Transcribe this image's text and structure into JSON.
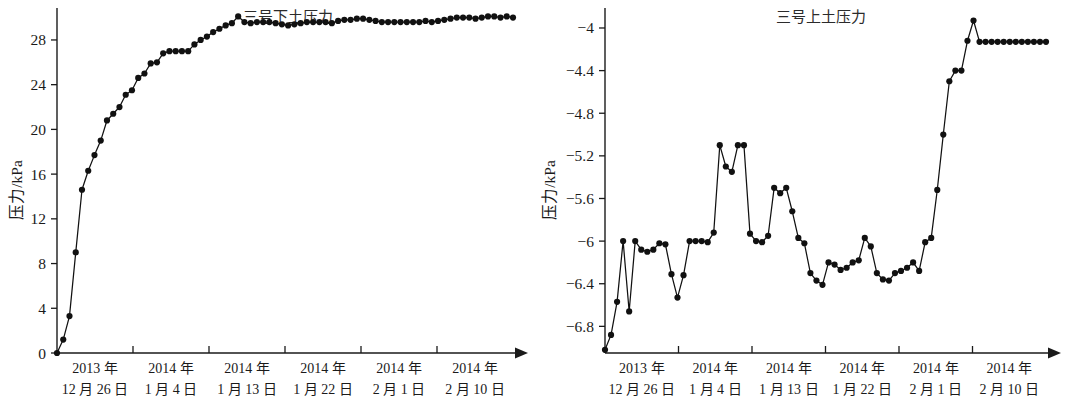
{
  "figure": {
    "background_color": "#ffffff",
    "series_color": "#111111",
    "axis_color": "#1a1a1a",
    "panel_count": 2
  },
  "chart_data": [
    {
      "type": "line",
      "panel": "left",
      "title": "三号下土压力",
      "xlabel": "",
      "ylabel": "压力/kPa",
      "ylim": [
        0,
        30.5
      ],
      "yticks": [
        0,
        4,
        8,
        12,
        16,
        20,
        24,
        28
      ],
      "ytick_labels": [
        "0",
        "4",
        "8",
        "12",
        "16",
        "20",
        "24",
        "28"
      ],
      "xtick_labels": [
        "2013 年\n12 月 26 日",
        "2014 年\n1 月 4 日",
        "2014 年\n1 月 13 日",
        "2014 年\n1 月 22 日",
        "2014 年\n2 月 1 日",
        "2014 年\n2 月 10 日"
      ],
      "xtick_label_lines": [
        [
          "2013 年",
          "12 月 26 日"
        ],
        [
          "2014 年",
          "1 月 4 日"
        ],
        [
          "2014 年",
          "1 月 13 日"
        ],
        [
          "2014 年",
          "1 月 22 日"
        ],
        [
          "2014 年",
          "2 月 1 日"
        ],
        [
          "2014 年",
          "2 月 10 日"
        ]
      ],
      "grid": false,
      "legend": "none",
      "marker": "filled-circle",
      "x": [
        0,
        1,
        2,
        3,
        4,
        5,
        6,
        7,
        8,
        9,
        10,
        11,
        12,
        13,
        14,
        15,
        16,
        17,
        18,
        19,
        20,
        21,
        22,
        23,
        24,
        25,
        26,
        27,
        28,
        29,
        30,
        31,
        32,
        33,
        34,
        35,
        36,
        37,
        38,
        39,
        40,
        41,
        42,
        43,
        44,
        45,
        46,
        47,
        48,
        49,
        50,
        51,
        52,
        53,
        54,
        55,
        56,
        57,
        58,
        59,
        60,
        61,
        62,
        63,
        64,
        65,
        66,
        67,
        68,
        69,
        70,
        71,
        72,
        73
      ],
      "values": [
        0.0,
        1.2,
        3.3,
        9.0,
        14.6,
        16.3,
        17.7,
        19.0,
        20.8,
        21.4,
        22.0,
        23.1,
        23.5,
        24.6,
        25.0,
        25.9,
        26.0,
        26.8,
        27.0,
        27.0,
        27.0,
        27.0,
        27.6,
        28.0,
        28.3,
        28.7,
        29.0,
        29.3,
        29.5,
        30.1,
        29.6,
        29.5,
        29.6,
        29.6,
        29.6,
        29.5,
        29.4,
        29.3,
        29.4,
        29.5,
        29.6,
        29.6,
        29.6,
        29.6,
        29.5,
        29.7,
        29.8,
        29.8,
        29.9,
        29.9,
        29.8,
        29.7,
        29.6,
        29.6,
        29.6,
        29.6,
        29.6,
        29.6,
        29.6,
        29.7,
        29.6,
        29.7,
        29.8,
        29.9,
        30.0,
        30.0,
        30.0,
        29.9,
        30.0,
        30.1,
        30.1,
        30.0,
        30.1,
        30.0
      ]
    },
    {
      "type": "line",
      "panel": "right",
      "title": "三号上土压力",
      "xlabel": "",
      "ylabel": "压力/kPa",
      "ylim": [
        -7.05,
        -3.85
      ],
      "yticks": [
        -6.8,
        -6.4,
        -6.0,
        -5.6,
        -5.2,
        -4.8,
        -4.4,
        -4.0
      ],
      "ytick_labels": [
        "-6.8",
        "-6.4",
        "-6",
        "-5.6",
        "-5.2",
        "-4.8",
        "-4.4",
        "-4"
      ],
      "xtick_labels": [
        "2013 年\n12 月 26 日",
        "2014 年\n1 月 4 日",
        "2014 年\n1 月 13 日",
        "2014 年\n1 月 22 日",
        "2014 年\n2 月 1 日",
        "2014 年\n2 月 10 日"
      ],
      "xtick_label_lines": [
        [
          "2013 年",
          "12 月 26 日"
        ],
        [
          "2014 年",
          "1 月 4 日"
        ],
        [
          "2014 年",
          "1 月 13 日"
        ],
        [
          "2014 年",
          "1 月 22 日"
        ],
        [
          "2014 年",
          "2 月 1 日"
        ],
        [
          "2014 年",
          "2 月 10 日"
        ]
      ],
      "grid": false,
      "legend": "none",
      "marker": "filled-circle",
      "x": [
        0,
        1,
        2,
        3,
        4,
        5,
        6,
        7,
        8,
        9,
        10,
        11,
        12,
        13,
        14,
        15,
        16,
        17,
        18,
        19,
        20,
        21,
        22,
        23,
        24,
        25,
        26,
        27,
        28,
        29,
        30,
        31,
        32,
        33,
        34,
        35,
        36,
        37,
        38,
        39,
        40,
        41,
        42,
        43,
        44,
        45,
        46,
        47,
        48,
        49,
        50,
        51,
        52,
        53,
        54,
        55,
        56,
        57,
        58,
        59,
        60,
        61,
        62,
        63,
        64,
        65,
        66,
        67,
        68,
        69,
        70,
        71,
        72,
        73
      ],
      "values": [
        -7.02,
        -6.88,
        -6.57,
        -6.0,
        -6.66,
        -6.0,
        -6.08,
        -6.1,
        -6.08,
        -6.02,
        -6.03,
        -6.31,
        -6.53,
        -6.32,
        -6.0,
        -6.0,
        -6.0,
        -6.01,
        -5.92,
        -5.1,
        -5.3,
        -5.35,
        -5.1,
        -5.1,
        -5.93,
        -6.0,
        -6.01,
        -5.95,
        -5.5,
        -5.55,
        -5.5,
        -5.72,
        -5.97,
        -6.02,
        -6.3,
        -6.37,
        -6.41,
        -6.2,
        -6.22,
        -6.27,
        -6.25,
        -6.2,
        -6.18,
        -5.97,
        -6.05,
        -6.3,
        -6.36,
        -6.37,
        -6.3,
        -6.28,
        -6.25,
        -6.2,
        -6.28,
        -6.01,
        -5.97,
        -5.52,
        -5.0,
        -4.5,
        -4.4,
        -4.4,
        -4.12,
        -3.93,
        -4.13,
        -4.13,
        -4.13,
        -4.13,
        -4.13,
        -4.13,
        -4.13,
        -4.13,
        -4.13,
        -4.13,
        -4.13,
        -4.13
      ],
      "values_note_trailing_truncated": false
    }
  ]
}
